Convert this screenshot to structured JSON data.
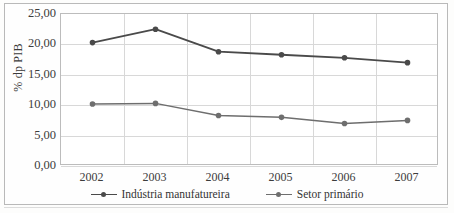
{
  "chart_data": {
    "type": "line",
    "title": "",
    "subtitle": "",
    "xlabel": "",
    "ylabel": "% dp PIB",
    "categories": [
      "2002",
      "2003",
      "2004",
      "2005",
      "2006",
      "2007"
    ],
    "x": [
      2002,
      2003,
      2004,
      2005,
      2006,
      2007
    ],
    "ylim": [
      0,
      25
    ],
    "y_ticks": [
      0,
      5,
      10,
      15,
      20,
      25
    ],
    "y_tick_labels": [
      "0,00",
      "5,00",
      "10,00",
      "15,00",
      "20,00",
      "25,00"
    ],
    "grid": true,
    "legend_position": "bottom",
    "series": [
      {
        "name": "Indústria manufatureira",
        "color": "#4a4a4a",
        "marker": "circle",
        "values": [
          20.3,
          22.5,
          18.8,
          18.3,
          17.8,
          17.0
        ]
      },
      {
        "name": "Setor primário",
        "color": "#6e6e6e",
        "marker": "circle",
        "values": [
          10.2,
          10.3,
          8.3,
          8.0,
          7.0,
          7.5
        ]
      }
    ]
  },
  "axes": {
    "y_title": "% dp PIB"
  },
  "legend": {
    "items": [
      {
        "label": "Indústria manufatureira"
      },
      {
        "label": "Setor primário"
      }
    ]
  },
  "colors": {
    "series_1": "#4a4a4a",
    "series_2": "#6e6e6e",
    "grid": "#d8d8d8",
    "frame": "#bcbcbc",
    "text": "#3c3c3c",
    "background": "#ffffff"
  }
}
